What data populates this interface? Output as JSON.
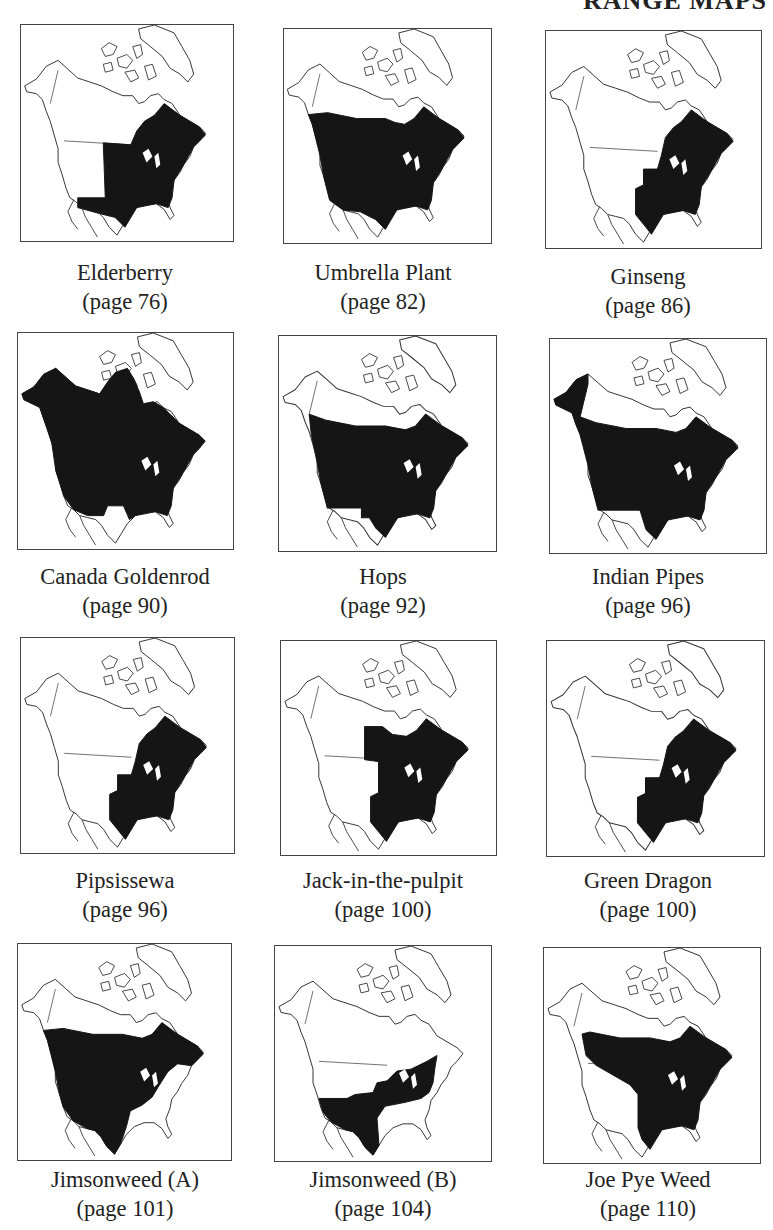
{
  "header": {
    "title": "RANGE MAPS"
  },
  "colors": {
    "range_fill": "#151515",
    "outline": "#333333",
    "background": "#ffffff"
  },
  "maps": [
    {
      "name": "Elderberry",
      "page": "(page 76)",
      "range": "east_central_plains"
    },
    {
      "name": "Umbrella Plant",
      "page": "(page 82)",
      "range": "most_us_southern_canada_except_sw"
    },
    {
      "name": "Ginseng",
      "page": "(page 86)",
      "range": "eastern"
    },
    {
      "name": "Canada Goldenrod",
      "page": "(page 90)",
      "range": "nearly_all_incl_arctic"
    },
    {
      "name": "Hops",
      "page": "(page 92)",
      "range": "most_us_southern_canada"
    },
    {
      "name": "Indian Pipes",
      "page": "(page 96)",
      "range": "alaska_plus_us_southern_canada"
    },
    {
      "name": "Pipsissewa",
      "page": "(page 96)",
      "range": "eastern"
    },
    {
      "name": "Jack-in-the-pulpit",
      "page": "(page 100)",
      "range": "eastern_plus_manitoba"
    },
    {
      "name": "Green Dragon",
      "page": "(page 100)",
      "range": "eastern"
    },
    {
      "name": "Jimsonweed (A)",
      "page": "(page 101)",
      "range": "west_central_canada"
    },
    {
      "name": "Jimsonweed (B)",
      "page": "(page 104)",
      "range": "southern_band"
    },
    {
      "name": "Joe Pye Weed",
      "page": "(page 110)",
      "range": "central_eastern_canada"
    }
  ]
}
